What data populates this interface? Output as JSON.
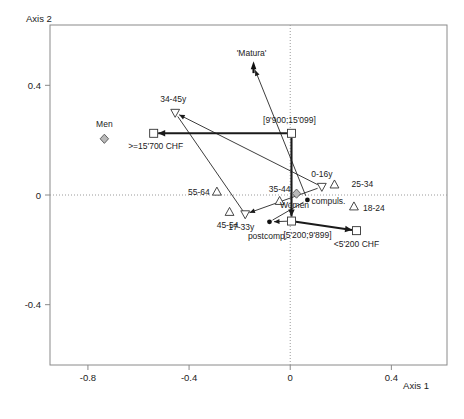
{
  "chart_data": {
    "type": "scatter",
    "title": "",
    "xlabel": "Axis 1",
    "ylabel": "Axis 2",
    "xlim": [
      -0.95,
      0.62
    ],
    "ylim": [
      -0.62,
      0.62
    ],
    "xticks": [
      -0.8,
      -0.4,
      0,
      0.4
    ],
    "xticklabels": [
      "-0.8",
      "-0.4",
      "0",
      "0.4"
    ],
    "yticks": [
      0.4,
      0,
      -0.4
    ],
    "yticklabels": [
      "0.4",
      "0",
      "-0.4"
    ],
    "grid": false,
    "zero_lines": true,
    "legend": "none",
    "points": [
      {
        "label": "Men",
        "x": -0.735,
        "y": 0.205,
        "marker": "diamond",
        "label_dx": 0,
        "label_dy": -12,
        "anchor": "middle"
      },
      {
        "label": "Women",
        "x": 0.025,
        "y": 0.005,
        "marker": "diamond",
        "label_dx": -2,
        "label_dy": 14,
        "anchor": "middle"
      },
      {
        "label": ">=15'700 CHF",
        "x": -0.54,
        "y": 0.225,
        "marker": "square",
        "label_dx": 2,
        "label_dy": 16,
        "anchor": "middle"
      },
      {
        "label": "[9'900;15'099]",
        "x": 0.005,
        "y": 0.225,
        "marker": "square",
        "label_dx": -2,
        "label_dy": -10,
        "anchor": "middle"
      },
      {
        "label": "[5'200;9'899]",
        "x": 0.005,
        "y": -0.095,
        "marker": "square",
        "label_dx": 16,
        "label_dy": 17,
        "anchor": "middle"
      },
      {
        "label": "<5'200 CHF",
        "x": 0.262,
        "y": -0.13,
        "marker": "square",
        "label_dx": 0,
        "label_dy": 16,
        "anchor": "middle"
      },
      {
        "label": "34-45y",
        "x": -0.455,
        "y": 0.3,
        "marker": "triangle-down",
        "label_dx": -2,
        "label_dy": -11,
        "anchor": "middle"
      },
      {
        "label": "17-33y",
        "x": -0.178,
        "y": -0.07,
        "marker": "triangle-down",
        "label_dx": -4,
        "label_dy": 16,
        "anchor": "middle"
      },
      {
        "label": "0-16y",
        "x": 0.125,
        "y": 0.03,
        "marker": "triangle-down",
        "label_dx": 0,
        "label_dy": -10,
        "anchor": "middle"
      },
      {
        "label": "55-64",
        "x": -0.29,
        "y": 0.012,
        "marker": "triangle-up",
        "label_dx": -18,
        "label_dy": 3,
        "anchor": "middle"
      },
      {
        "label": "45-54",
        "x": -0.24,
        "y": -0.062,
        "marker": "triangle-up",
        "label_dx": -2,
        "label_dy": 16,
        "anchor": "middle"
      },
      {
        "label": "35-44",
        "x": -0.042,
        "y": -0.022,
        "marker": "triangle-up",
        "label_dx": 0,
        "label_dy": -9,
        "anchor": "middle"
      },
      {
        "label": "25-34",
        "x": 0.175,
        "y": 0.038,
        "marker": "triangle-up",
        "label_dx": 17,
        "label_dy": 2,
        "anchor": "start"
      },
      {
        "label": "18-24",
        "x": 0.252,
        "y": -0.042,
        "marker": "triangle-up",
        "label_dx": 9,
        "label_dy": 4,
        "anchor": "start"
      },
      {
        "label": "compuls.",
        "x": 0.068,
        "y": -0.018,
        "marker": "dot",
        "label_dx": 4,
        "label_dy": 4,
        "anchor": "start"
      },
      {
        "label": "postcomp.",
        "x": -0.082,
        "y": -0.098,
        "marker": "dot",
        "label_dx": -2,
        "label_dy": 17,
        "anchor": "middle"
      },
      {
        "label": "'Matura'",
        "x": -0.145,
        "y": 0.47,
        "marker": "arrow-head",
        "label_dx": -2,
        "label_dy": -10,
        "anchor": "middle"
      }
    ],
    "connectors": [
      {
        "from": "[9'900;15'099]",
        "to": ">=15'700 CHF",
        "style": "thick-arrow"
      },
      {
        "from": "[9'900;15'099]",
        "to": "[5'200;9'899]",
        "style": "thick-arrow"
      },
      {
        "from": "[5'200;9'899]",
        "to": "<5'200 CHF",
        "style": "thick-arrow"
      },
      {
        "from": "[5'200;9'899]",
        "to": "postcomp.",
        "style": "thin-arrow"
      },
      {
        "from": "compuls.",
        "to": "'Matura'",
        "style": "thin-arrow"
      },
      {
        "from": "compuls.",
        "to": "postcomp.",
        "style": "thin-line"
      },
      {
        "from": "0-16y",
        "to": "34-45y",
        "style": "thin-arrow"
      },
      {
        "from": "0-16y",
        "to": "17-33y",
        "style": "thin-arrow"
      },
      {
        "from": "34-45y",
        "to": "17-33y",
        "style": "thin-line"
      }
    ]
  },
  "axes": {
    "x_title": "Axis 1",
    "y_title": "Axis 2"
  }
}
